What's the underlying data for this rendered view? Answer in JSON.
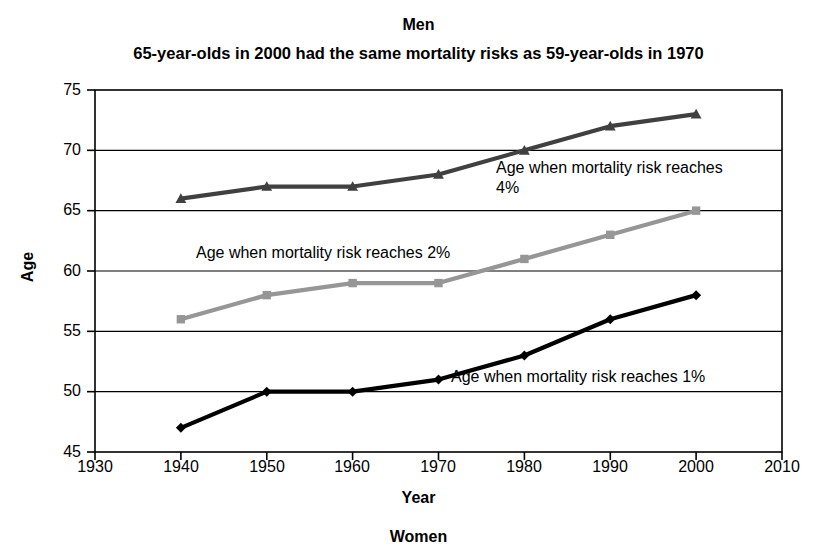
{
  "chart_data": {
    "type": "line",
    "title": "Men",
    "subtitle": "65-year-olds in 2000 had the same mortality risks as 59-year-olds in 1970",
    "bottom_caption": "Women",
    "xlabel": "Year",
    "ylabel": "Age",
    "x": [
      1940,
      1950,
      1960,
      1970,
      1980,
      1990,
      2000
    ],
    "xlim": [
      1930,
      2010
    ],
    "ylim": [
      45,
      75
    ],
    "xticks": [
      "1930",
      "1940",
      "1950",
      "1960",
      "1970",
      "1980",
      "1990",
      "2000",
      "2010"
    ],
    "yticks": [
      "45",
      "50",
      "55",
      "60",
      "65",
      "70",
      "75"
    ],
    "grid": "horizontal",
    "legend": "none (inline annotations)",
    "series": [
      {
        "name": "Age when mortality risk reaches 4%",
        "values": [
          66,
          67,
          67,
          68,
          70,
          72,
          73
        ],
        "color": "#404040",
        "marker": "triangle"
      },
      {
        "name": "Age when mortality risk reaches 2%",
        "values": [
          56,
          58,
          59,
          59,
          61,
          63,
          65
        ],
        "color": "#969696",
        "marker": "square"
      },
      {
        "name": "Age when mortality risk reaches 1%",
        "values": [
          47,
          50,
          50,
          51,
          53,
          56,
          58
        ],
        "color": "#000000",
        "marker": "diamond"
      }
    ],
    "annotations": [
      {
        "text": "Age when mortality risk reaches 4%",
        "line1": "Age when mortality risk reaches",
        "line2": "4%"
      },
      {
        "text": "Age when mortality risk reaches 2%"
      },
      {
        "text": "Age when mortality risk reaches 1%"
      }
    ]
  }
}
